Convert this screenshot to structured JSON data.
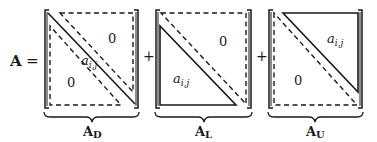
{
  "equation": {
    "lhs_label": "A",
    "equals": "=",
    "plus_1": "+",
    "plus_2": "+"
  },
  "matrices": [
    {
      "id": "diagonal",
      "label_base": "A",
      "label_sub": "D",
      "upper_text": "0",
      "lower_text": "0",
      "diag_text": "a",
      "diag_sub": "i,j",
      "description": "diagonal band solid, upper and lower triangles dashed (zero)"
    },
    {
      "id": "lower",
      "label_base": "A",
      "label_sub": "L",
      "upper_text": "0",
      "lower_text": "a",
      "lower_sub": "i,j",
      "description": "strictly lower triangle solid, upper triangle dashed (zero)"
    },
    {
      "id": "upper",
      "label_base": "A",
      "label_sub": "U",
      "upper_text": "a",
      "upper_sub": "i,j",
      "lower_text": "0",
      "description": "strictly upper triangle solid, lower triangle dashed (zero)"
    }
  ],
  "colors": {
    "ink": "#1a1a1a",
    "background": "#ffffff"
  }
}
